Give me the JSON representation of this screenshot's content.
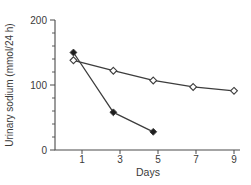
{
  "figure": {
    "background": "#ffffff",
    "axis_color": "#4a4a4a",
    "line_color": "#3d3d3d",
    "text_color": "#3a3a3a",
    "marker_filled_color": "#1f1f1f",
    "marker_open_fill": "#ffffff"
  },
  "chart_data": {
    "type": "line",
    "title": "",
    "xlabel": "Days",
    "ylabel": "Urinary sodium (mmol/24 h)",
    "xlim": [
      -0.4,
      9.3
    ],
    "ylim": [
      0,
      200
    ],
    "x_ticks": [
      1,
      3,
      5,
      7,
      9
    ],
    "y_ticks": [
      0,
      100,
      200
    ],
    "y_minor_tick_step": 20,
    "grid": false,
    "legend_position": "none",
    "series": [
      {
        "name": "rapid-decline-filled-diamond",
        "marker": "filled-diamond",
        "x": [
          0.55,
          2.65,
          4.75
        ],
        "values": [
          150,
          58,
          28
        ]
      },
      {
        "name": "slow-decline-open-diamond",
        "marker": "open-diamond",
        "x": [
          0.55,
          2.65,
          4.75,
          6.85,
          9.0
        ],
        "values": [
          138,
          122,
          107,
          97,
          91
        ]
      }
    ]
  }
}
